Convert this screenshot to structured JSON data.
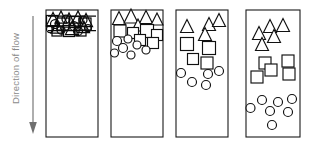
{
  "figure": {
    "background_color": "#ffffff",
    "stroke_color": "#111111",
    "label_color": "#8a8a8a",
    "width": 309,
    "height": 148
  },
  "flow_axis": {
    "label": "Direction of flow",
    "arrow_direction": "down",
    "arrow_icon": "down-arrow-icon",
    "arrow_x": 33,
    "arrow_y_start": 18,
    "arrow_y_end": 132
  },
  "panels": [
    {
      "id": "panel-1",
      "stage_label": "1",
      "x": 46,
      "y": 10,
      "width": 52,
      "height": 127,
      "description": "fully mixed dense cluster at top",
      "shapes": [
        {
          "type": "triangle",
          "cx": 53,
          "cy": 19,
          "size": 13
        },
        {
          "type": "triangle",
          "cx": 61,
          "cy": 17,
          "size": 12
        },
        {
          "type": "triangle",
          "cx": 69,
          "cy": 20,
          "size": 14
        },
        {
          "type": "triangle",
          "cx": 78,
          "cy": 17,
          "size": 12
        },
        {
          "type": "triangle",
          "cx": 86,
          "cy": 20,
          "size": 13
        },
        {
          "type": "triangle",
          "cx": 57,
          "cy": 27,
          "size": 12
        },
        {
          "type": "triangle",
          "cx": 72,
          "cy": 28,
          "size": 13
        },
        {
          "type": "triangle",
          "cx": 84,
          "cy": 27,
          "size": 11
        },
        {
          "type": "square",
          "cx": 52,
          "cy": 21,
          "size": 11
        },
        {
          "type": "square",
          "cx": 63,
          "cy": 24,
          "size": 12
        },
        {
          "type": "square",
          "cx": 75,
          "cy": 22,
          "size": 11
        },
        {
          "type": "square",
          "cx": 85,
          "cy": 24,
          "size": 12
        },
        {
          "type": "square",
          "cx": 57,
          "cy": 31,
          "size": 10
        },
        {
          "type": "square",
          "cx": 69,
          "cy": 31,
          "size": 11
        },
        {
          "type": "square",
          "cx": 81,
          "cy": 31,
          "size": 10
        },
        {
          "type": "circle",
          "cx": 55,
          "cy": 24,
          "size": 9
        },
        {
          "type": "circle",
          "cx": 66,
          "cy": 19,
          "size": 8
        },
        {
          "type": "circle",
          "cx": 74,
          "cy": 26,
          "size": 9
        },
        {
          "type": "circle",
          "cx": 83,
          "cy": 20,
          "size": 8
        },
        {
          "type": "circle",
          "cx": 61,
          "cy": 30,
          "size": 8
        },
        {
          "type": "circle",
          "cx": 78,
          "cy": 31,
          "size": 9
        },
        {
          "type": "circle",
          "cx": 88,
          "cy": 28,
          "size": 7
        },
        {
          "type": "circle",
          "cx": 50,
          "cy": 29,
          "size": 7
        }
      ]
    },
    {
      "id": "panel-2",
      "stage_label": "2",
      "x": 111,
      "y": 10,
      "width": 52,
      "height": 127,
      "description": "partial segregation beginning",
      "shapes": [
        {
          "type": "triangle",
          "cx": 119,
          "cy": 18,
          "size": 13
        },
        {
          "type": "triangle",
          "cx": 131,
          "cy": 16,
          "size": 14
        },
        {
          "type": "triangle",
          "cx": 146,
          "cy": 17,
          "size": 13
        },
        {
          "type": "triangle",
          "cx": 157,
          "cy": 19,
          "size": 12
        },
        {
          "type": "triangle",
          "cx": 138,
          "cy": 25,
          "size": 12
        },
        {
          "type": "square",
          "cx": 120,
          "cy": 31,
          "size": 12
        },
        {
          "type": "square",
          "cx": 133,
          "cy": 33,
          "size": 11
        },
        {
          "type": "square",
          "cx": 147,
          "cy": 31,
          "size": 13
        },
        {
          "type": "square",
          "cx": 157,
          "cy": 35,
          "size": 11
        },
        {
          "type": "square",
          "cx": 140,
          "cy": 40,
          "size": 11
        },
        {
          "type": "square",
          "cx": 153,
          "cy": 43,
          "size": 11
        },
        {
          "type": "circle",
          "cx": 117,
          "cy": 41,
          "size": 9
        },
        {
          "type": "circle",
          "cx": 128,
          "cy": 39,
          "size": 8
        },
        {
          "type": "circle",
          "cx": 137,
          "cy": 45,
          "size": 8
        },
        {
          "type": "circle",
          "cx": 123,
          "cy": 48,
          "size": 9
        },
        {
          "type": "circle",
          "cx": 146,
          "cy": 50,
          "size": 8
        },
        {
          "type": "circle",
          "cx": 114,
          "cy": 53,
          "size": 9
        },
        {
          "type": "circle",
          "cx": 131,
          "cy": 55,
          "size": 8
        }
      ]
    },
    {
      "id": "panel-3",
      "stage_label": "3",
      "x": 176,
      "y": 10,
      "width": 52,
      "height": 127,
      "description": "clear layering: triangles, squares, circles",
      "shapes": [
        {
          "type": "triangle",
          "cx": 187,
          "cy": 26,
          "size": 13
        },
        {
          "type": "triangle",
          "cx": 209,
          "cy": 24,
          "size": 13
        },
        {
          "type": "triangle",
          "cx": 219,
          "cy": 20,
          "size": 13
        },
        {
          "type": "triangle",
          "cx": 205,
          "cy": 34,
          "size": 13
        },
        {
          "type": "square",
          "cx": 187,
          "cy": 44,
          "size": 13
        },
        {
          "type": "square",
          "cx": 209,
          "cy": 48,
          "size": 13
        },
        {
          "type": "square",
          "cx": 193,
          "cy": 59,
          "size": 11
        },
        {
          "type": "square",
          "cx": 207,
          "cy": 63,
          "size": 12
        },
        {
          "type": "circle",
          "cx": 181,
          "cy": 73,
          "size": 9
        },
        {
          "type": "circle",
          "cx": 208,
          "cy": 74,
          "size": 9
        },
        {
          "type": "circle",
          "cx": 219,
          "cy": 71,
          "size": 9
        },
        {
          "type": "circle",
          "cx": 192,
          "cy": 82,
          "size": 9
        },
        {
          "type": "circle",
          "cx": 206,
          "cy": 85,
          "size": 9
        }
      ]
    },
    {
      "id": "panel-4",
      "stage_label": "4",
      "x": 246,
      "y": 10,
      "width": 54,
      "height": 127,
      "description": "full stratification into three bands",
      "shapes": [
        {
          "type": "triangle",
          "cx": 270,
          "cy": 26,
          "size": 13
        },
        {
          "type": "triangle",
          "cx": 283,
          "cy": 25,
          "size": 13
        },
        {
          "type": "triangle",
          "cx": 259,
          "cy": 33,
          "size": 13
        },
        {
          "type": "triangle",
          "cx": 274,
          "cy": 36,
          "size": 13
        },
        {
          "type": "triangle",
          "cx": 262,
          "cy": 44,
          "size": 13
        },
        {
          "type": "square",
          "cx": 265,
          "cy": 63,
          "size": 12
        },
        {
          "type": "square",
          "cx": 288,
          "cy": 61,
          "size": 12
        },
        {
          "type": "square",
          "cx": 271,
          "cy": 70,
          "size": 12
        },
        {
          "type": "square",
          "cx": 289,
          "cy": 74,
          "size": 12
        },
        {
          "type": "square",
          "cx": 257,
          "cy": 77,
          "size": 12
        },
        {
          "type": "circle",
          "cx": 262,
          "cy": 100,
          "size": 9
        },
        {
          "type": "circle",
          "cx": 278,
          "cy": 102,
          "size": 9
        },
        {
          "type": "circle",
          "cx": 292,
          "cy": 99,
          "size": 9
        },
        {
          "type": "circle",
          "cx": 250,
          "cy": 108,
          "size": 9
        },
        {
          "type": "circle",
          "cx": 270,
          "cy": 111,
          "size": 9
        },
        {
          "type": "circle",
          "cx": 288,
          "cy": 112,
          "size": 9
        },
        {
          "type": "circle",
          "cx": 272,
          "cy": 125,
          "size": 9
        }
      ]
    }
  ]
}
